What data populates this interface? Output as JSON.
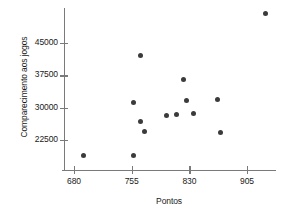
{
  "chart_data": {
    "type": "scatter",
    "title": "",
    "xlabel": "Pontos",
    "ylabel": "Comparecimento aos jogos",
    "xticks": [
      680,
      755,
      830,
      905
    ],
    "xtick_labels": [
      "680",
      "755",
      "830",
      "905"
    ],
    "yticks": [
      22500,
      30000,
      37500,
      45000
    ],
    "ytick_labels": [
      "22500",
      "30000",
      "37500",
      "45000"
    ],
    "xlim": [
      660,
      945
    ],
    "ylim": [
      16000,
      53500
    ],
    "grid": false,
    "legend": null,
    "marker": {
      "shape": "circle",
      "color": "#3b3b3b",
      "size_px": 5
    },
    "axis_color": "#7a7a7a",
    "points": [
      {
        "x": 692,
        "y": 18800
      },
      {
        "x": 758,
        "y": 18800
      },
      {
        "x": 758,
        "y": 31300
      },
      {
        "x": 766,
        "y": 42000
      },
      {
        "x": 767,
        "y": 26700
      },
      {
        "x": 772,
        "y": 24400
      },
      {
        "x": 800,
        "y": 28200
      },
      {
        "x": 813,
        "y": 28400
      },
      {
        "x": 822,
        "y": 36600
      },
      {
        "x": 826,
        "y": 31700
      },
      {
        "x": 835,
        "y": 28700
      },
      {
        "x": 867,
        "y": 32000
      },
      {
        "x": 871,
        "y": 24200
      },
      {
        "x": 929,
        "y": 51800
      }
    ]
  }
}
